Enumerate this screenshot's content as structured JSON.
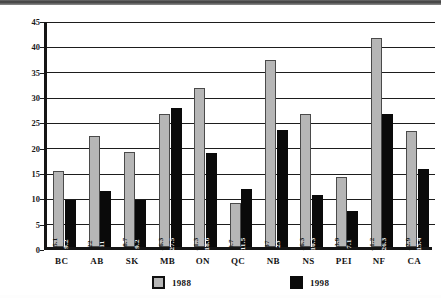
{
  "chart_data": {
    "type": "bar",
    "title": "",
    "xlabel": "",
    "ylabel": "",
    "ylim": [
      0,
      45
    ],
    "ytick_step": 5,
    "yticks": [
      "0",
      "5",
      "10",
      "15",
      "20",
      "25",
      "30",
      "35",
      "40",
      "45"
    ],
    "grid": true,
    "legend_position": "bottom",
    "categories": [
      "BC",
      "AB",
      "SK",
      "MB",
      "ON",
      "QC",
      "NB",
      "NS",
      "PEI",
      "NF",
      "CA"
    ],
    "series": [
      {
        "name": "1988",
        "color": "#b6b6b6",
        "values": [
          15.1,
          22,
          18.7,
          26.3,
          31.3,
          8.7,
          37,
          26.3,
          13.9,
          41.2,
          22.9
        ],
        "labels": [
          "15.1",
          "22",
          "18.7",
          "26.3",
          "31.3",
          "8.7",
          "37",
          "26.3",
          "13.9",
          "41.2",
          "22.9"
        ]
      },
      {
        "name": "1998",
        "color": "#0a0a0a",
        "values": [
          9.2,
          11,
          9.2,
          27.5,
          18.6,
          11.5,
          23,
          10.3,
          7.1,
          26.3,
          15.4
        ],
        "labels": [
          "9.2",
          "11",
          "9.2",
          "27.5",
          "18.6",
          "11.5",
          "23",
          "10.3",
          "7.1",
          "26.3",
          "15.4"
        ]
      }
    ]
  },
  "legend": {
    "items": [
      {
        "label": "1988",
        "swatch": "gray-swatch"
      },
      {
        "label": "1998",
        "swatch": "black-swatch"
      }
    ]
  },
  "caption": ""
}
